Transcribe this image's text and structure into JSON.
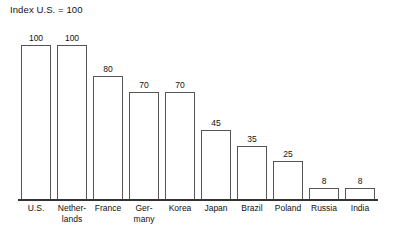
{
  "chart_data": {
    "type": "bar",
    "title": "Index U.S. = 100",
    "xlabel": "",
    "ylabel": "",
    "ylim": [
      0,
      100
    ],
    "grid": false,
    "legend": "none",
    "categories": [
      "U.S.",
      "Netherlands",
      "France",
      "Germany",
      "Korea",
      "Japan",
      "Brazil",
      "Poland",
      "Russia",
      "India"
    ],
    "tick_labels": [
      "U.S.",
      "Nether-\nlands",
      "France",
      "Ger-\nmany",
      "Korea",
      "Japan",
      "Brazil",
      "Poland",
      "Russia",
      "India"
    ],
    "values": [
      100,
      100,
      80,
      70,
      70,
      45,
      35,
      25,
      8,
      8
    ],
    "value_labels": [
      "100",
      "100",
      "80",
      "70",
      "70",
      "45",
      "35",
      "25",
      "8",
      "8"
    ],
    "bar_fill": "#ffffff",
    "bar_stroke": "#555555",
    "axis_color": "#333333",
    "text_color": "#111111",
    "background": "#ffffff"
  }
}
